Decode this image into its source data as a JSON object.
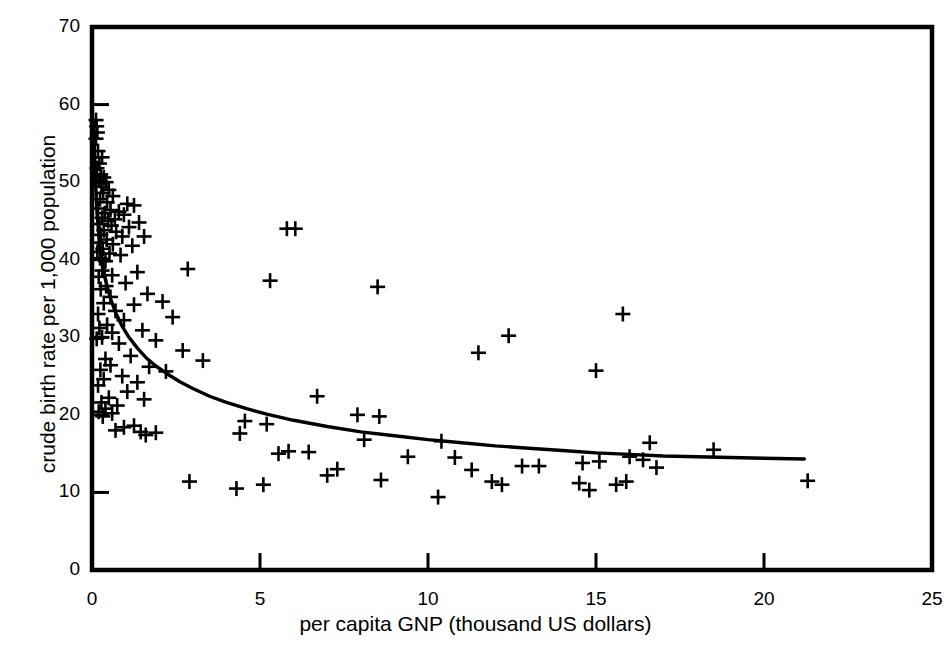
{
  "chart_data": {
    "type": "scatter",
    "title": "",
    "xlabel": "per capita GNP (thousand US dollars)",
    "ylabel": "crude birth rate per 1,000 population",
    "xlim": [
      0,
      25
    ],
    "ylim": [
      0,
      70
    ],
    "xticks": [
      0,
      5,
      10,
      15,
      20,
      25
    ],
    "yticks": [
      0,
      10,
      20,
      30,
      40,
      50,
      60,
      70
    ],
    "xtick_labels": [
      "0",
      "5",
      "10",
      "15",
      "20",
      "25"
    ],
    "ytick_labels": [
      "0",
      "10",
      "20",
      "30",
      "40",
      "50",
      "60",
      "70"
    ],
    "grid": false,
    "legend": null,
    "marker": "plus",
    "marker_color": "#000000",
    "line_color": "#000000",
    "frame_color": "#000000",
    "background": "#ffffff",
    "series": [
      {
        "name": "countries",
        "type": "scatter",
        "points": [
          [
            0.12,
            58.0
          ],
          [
            0.14,
            57.2
          ],
          [
            0.16,
            56.4
          ],
          [
            0.12,
            55.6
          ],
          [
            0.18,
            54.0
          ],
          [
            0.3,
            53.2
          ],
          [
            0.22,
            52.4
          ],
          [
            0.15,
            51.8
          ],
          [
            0.26,
            51.0
          ],
          [
            0.35,
            50.6
          ],
          [
            0.2,
            50.2
          ],
          [
            0.42,
            50.0
          ],
          [
            0.28,
            49.4
          ],
          [
            0.5,
            49.0
          ],
          [
            0.33,
            48.6
          ],
          [
            0.62,
            48.2
          ],
          [
            0.24,
            47.8
          ],
          [
            0.45,
            47.4
          ],
          [
            1.05,
            47.2
          ],
          [
            1.25,
            47.0
          ],
          [
            0.18,
            46.6
          ],
          [
            0.55,
            46.4
          ],
          [
            0.8,
            46.2
          ],
          [
            0.38,
            46.0
          ],
          [
            0.95,
            45.8
          ],
          [
            0.3,
            45.4
          ],
          [
            0.68,
            45.2
          ],
          [
            0.48,
            45.0
          ],
          [
            1.4,
            44.8
          ],
          [
            0.22,
            44.6
          ],
          [
            0.58,
            44.4
          ],
          [
            1.1,
            44.2
          ],
          [
            5.8,
            44.0
          ],
          [
            6.05,
            44.0
          ],
          [
            0.35,
            43.8
          ],
          [
            0.72,
            43.6
          ],
          [
            0.26,
            43.2
          ],
          [
            0.9,
            43.0
          ],
          [
            1.55,
            43.0
          ],
          [
            0.44,
            42.6
          ],
          [
            0.2,
            42.2
          ],
          [
            0.62,
            42.0
          ],
          [
            1.2,
            41.8
          ],
          [
            0.32,
            41.4
          ],
          [
            0.16,
            41.0
          ],
          [
            0.52,
            40.8
          ],
          [
            0.85,
            40.6
          ],
          [
            0.24,
            40.2
          ],
          [
            0.4,
            39.8
          ],
          [
            2.85,
            38.8
          ],
          [
            0.3,
            38.6
          ],
          [
            1.35,
            38.4
          ],
          [
            0.6,
            38.0
          ],
          [
            0.2,
            37.8
          ],
          [
            5.3,
            37.3
          ],
          [
            1.0,
            37.0
          ],
          [
            0.42,
            36.6
          ],
          [
            8.5,
            36.5
          ],
          [
            0.26,
            36.2
          ],
          [
            1.65,
            35.6
          ],
          [
            0.55,
            35.2
          ],
          [
            2.1,
            34.6
          ],
          [
            0.35,
            34.4
          ],
          [
            1.25,
            34.2
          ],
          [
            0.7,
            33.4
          ],
          [
            0.18,
            33.0
          ],
          [
            2.4,
            32.6
          ],
          [
            0.95,
            32.2
          ],
          [
            0.45,
            31.6
          ],
          [
            0.22,
            31.2
          ],
          [
            1.5,
            30.9
          ],
          [
            0.6,
            30.6
          ],
          [
            12.4,
            30.2
          ],
          [
            0.3,
            30.0
          ],
          [
            0.14,
            29.8
          ],
          [
            1.9,
            29.6
          ],
          [
            0.8,
            29.2
          ],
          [
            15.8,
            33.0
          ],
          [
            11.5,
            28.0
          ],
          [
            2.7,
            28.3
          ],
          [
            1.15,
            27.6
          ],
          [
            0.4,
            27.2
          ],
          [
            3.3,
            27.0
          ],
          [
            0.55,
            26.4
          ],
          [
            1.7,
            26.2
          ],
          [
            0.25,
            25.8
          ],
          [
            15.0,
            25.7
          ],
          [
            2.2,
            25.6
          ],
          [
            0.9,
            25.0
          ],
          [
            0.35,
            24.6
          ],
          [
            1.35,
            24.2
          ],
          [
            0.18,
            23.8
          ],
          [
            1.05,
            23.0
          ],
          [
            6.7,
            22.4
          ],
          [
            0.5,
            22.2
          ],
          [
            1.55,
            22.0
          ],
          [
            0.28,
            21.6
          ],
          [
            0.75,
            21.2
          ],
          [
            0.4,
            20.8
          ],
          [
            0.2,
            20.4
          ],
          [
            0.6,
            20.2
          ],
          [
            0.32,
            19.8
          ],
          [
            8.55,
            19.8
          ],
          [
            7.9,
            20.0
          ],
          [
            4.55,
            19.2
          ],
          [
            5.2,
            18.8
          ],
          [
            1.25,
            18.6
          ],
          [
            0.95,
            18.4
          ],
          [
            4.4,
            17.6
          ],
          [
            1.45,
            17.8
          ],
          [
            0.7,
            18.0
          ],
          [
            1.9,
            17.7
          ],
          [
            1.6,
            17.4
          ],
          [
            10.4,
            16.6
          ],
          [
            16.6,
            16.4
          ],
          [
            18.5,
            15.5
          ],
          [
            8.1,
            16.8
          ],
          [
            5.85,
            15.3
          ],
          [
            6.45,
            15.2
          ],
          [
            5.55,
            15.0
          ],
          [
            9.4,
            14.6
          ],
          [
            10.8,
            14.5
          ],
          [
            15.1,
            14.0
          ],
          [
            16.4,
            14.2
          ],
          [
            16.0,
            14.6
          ],
          [
            14.6,
            13.8
          ],
          [
            12.8,
            13.4
          ],
          [
            13.3,
            13.4
          ],
          [
            16.8,
            13.2
          ],
          [
            7.3,
            13.0
          ],
          [
            11.3,
            12.9
          ],
          [
            8.6,
            11.6
          ],
          [
            7.0,
            12.2
          ],
          [
            2.9,
            11.4
          ],
          [
            5.1,
            11.0
          ],
          [
            4.3,
            10.5
          ],
          [
            11.9,
            11.4
          ],
          [
            12.2,
            11.0
          ],
          [
            14.8,
            10.3
          ],
          [
            15.6,
            11.0
          ],
          [
            15.9,
            11.4
          ],
          [
            14.5,
            11.2
          ],
          [
            10.3,
            9.4
          ],
          [
            21.3,
            11.5
          ]
        ]
      },
      {
        "name": "fitted-curve",
        "type": "line",
        "description": "decreasing fitted curve of birth rate versus per capita GNP",
        "points": [
          [
            0.05,
            58.0
          ],
          [
            0.1,
            50.5
          ],
          [
            0.15,
            46.0
          ],
          [
            0.22,
            42.5
          ],
          [
            0.3,
            39.8
          ],
          [
            0.4,
            37.4
          ],
          [
            0.55,
            35.0
          ],
          [
            0.7,
            33.2
          ],
          [
            0.9,
            31.4
          ],
          [
            1.1,
            30.0
          ],
          [
            1.35,
            28.6
          ],
          [
            1.6,
            27.4
          ],
          [
            1.9,
            26.3
          ],
          [
            2.2,
            25.4
          ],
          [
            2.6,
            24.3
          ],
          [
            3.0,
            23.4
          ],
          [
            3.5,
            22.4
          ],
          [
            4.0,
            21.6
          ],
          [
            4.6,
            20.8
          ],
          [
            5.2,
            20.1
          ],
          [
            6.0,
            19.3
          ],
          [
            7.0,
            18.5
          ],
          [
            8.0,
            17.8
          ],
          [
            9.0,
            17.3
          ],
          [
            10.0,
            16.8
          ],
          [
            11.0,
            16.4
          ],
          [
            12.0,
            16.0
          ],
          [
            13.0,
            15.7
          ],
          [
            14.0,
            15.4
          ],
          [
            15.0,
            15.1
          ],
          [
            16.0,
            14.9
          ],
          [
            17.0,
            14.7
          ],
          [
            18.0,
            14.6
          ],
          [
            19.0,
            14.5
          ],
          [
            20.0,
            14.4
          ],
          [
            21.2,
            14.3
          ]
        ]
      }
    ]
  }
}
